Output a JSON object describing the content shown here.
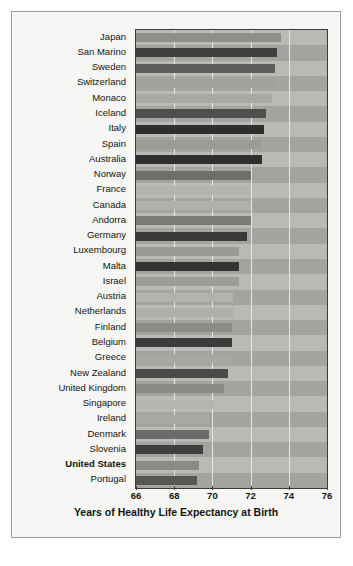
{
  "chart_data": {
    "type": "bar",
    "orientation": "horizontal",
    "title": "",
    "xlabel": "Years of Healthy Life Expectancy at Birth",
    "ylabel": "",
    "xlim": [
      66,
      76
    ],
    "xticks": [
      66,
      68,
      70,
      72,
      74,
      76
    ],
    "grid": true,
    "gridlines_at": [
      68,
      70,
      72,
      74
    ],
    "legend": null,
    "highlight_category": "United States",
    "categories": [
      "Japan",
      "San Marino",
      "Sweden",
      "Switzerland",
      "Monaco",
      "Iceland",
      "Italy",
      "Spain",
      "Australia",
      "Norway",
      "France",
      "Canada",
      "Andorra",
      "Germany",
      "Luxembourg",
      "Malta",
      "Israel",
      "Austria",
      "Netherlands",
      "Finland",
      "Belgium",
      "Greece",
      "New Zealand",
      "United Kingdom",
      "Singapore",
      "Ireland",
      "Denmark",
      "Slovenia",
      "United States",
      "Portugal"
    ],
    "values": [
      73.6,
      73.4,
      73.3,
      73.2,
      73.1,
      72.8,
      72.7,
      72.6,
      72.6,
      72.0,
      72.0,
      72.0,
      72.0,
      71.8,
      71.4,
      71.4,
      71.4,
      71.1,
      71.1,
      71.0,
      71.0,
      71.0,
      70.8,
      70.6,
      70.1,
      69.8,
      69.8,
      69.5,
      69.3,
      69.2
    ],
    "bar_colors": [
      "#8e8e8b",
      "#3f3f3f",
      "#5e5e5c",
      "#a0a09d",
      "#a8a8a5",
      "#4f4f4d",
      "#2f2f2f",
      "#9b9b98",
      "#303030",
      "#6e6e6c",
      "#b3b3b0",
      "#b0b0ad",
      "#7a7a77",
      "#3a3a3a",
      "#9a9a97",
      "#343434",
      "#9c9c99",
      "#b2b2af",
      "#aeaeab",
      "#8c8c89",
      "#3b3b3b",
      "#a6a6a3",
      "#4a4a48",
      "#8b8b88",
      "#b4b4b1",
      "#a9a9a6",
      "#6b6b69",
      "#3f3f3f",
      "#8a8a87",
      "#565654"
    ]
  },
  "axis": {
    "tick_labels": [
      "66",
      "68",
      "70",
      "72",
      "74",
      "76"
    ],
    "xaxis_title": "Years of Healthy Life Expectancy at Birth"
  }
}
